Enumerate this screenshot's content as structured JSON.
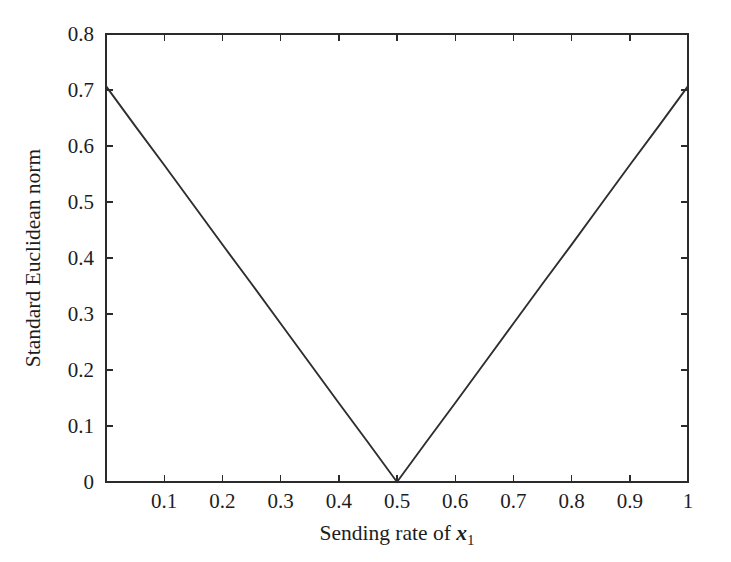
{
  "figure": {
    "background_color": "#ffffff",
    "line_color": "#2e2e2e",
    "axis_color": "#2b2b2b",
    "width": 731,
    "height": 562
  },
  "axes": {
    "x_title_prefix": "Sending rate of ",
    "x_title_var": "x",
    "x_title_sub": "1",
    "y_title": "Standard Euclidean norm",
    "x_tick_labels": [
      "0.1",
      "0.2",
      "0.3",
      "0.4",
      "0.5",
      "0.6",
      "0.7",
      "0.8",
      "0.9",
      "1"
    ],
    "y_tick_labels": [
      "0",
      "0.1",
      "0.2",
      "0.3",
      "0.4",
      "0.5",
      "0.6",
      "0.7",
      "0.8"
    ]
  },
  "chart_data": {
    "type": "line",
    "title": "",
    "subtitle": "",
    "xlabel": "Sending rate of x1",
    "ylabel": "Standard Euclidean norm",
    "xlim": [
      0,
      1
    ],
    "ylim": [
      0,
      0.8
    ],
    "xticks": [
      0,
      0.1,
      0.2,
      0.3,
      0.4,
      0.5,
      0.6,
      0.7,
      0.8,
      0.9,
      1
    ],
    "xticklabels": [
      "",
      "0.1",
      "0.2",
      "0.3",
      "0.4",
      "0.5",
      "0.6",
      "0.7",
      "0.8",
      "0.9",
      "1"
    ],
    "yticks": [
      0,
      0.1,
      0.2,
      0.3,
      0.4,
      0.5,
      0.6,
      0.7,
      0.8
    ],
    "yticklabels": [
      "0",
      "0.1",
      "0.2",
      "0.3",
      "0.4",
      "0.5",
      "0.6",
      "0.7",
      "0.8"
    ],
    "grid": false,
    "legend": false,
    "legend_position": "none",
    "tick_direction": "in",
    "box": true,
    "annotations": [],
    "series": [
      {
        "name": "Standard Euclidean norm",
        "color": "#2e2e2e",
        "linewidth": 1.9,
        "marker": "none",
        "x": [
          0.0,
          0.05,
          0.1,
          0.15,
          0.2,
          0.25,
          0.3,
          0.35,
          0.4,
          0.45,
          0.5,
          0.55,
          0.6,
          0.65,
          0.7,
          0.75,
          0.8,
          0.85,
          0.9,
          0.95,
          1.0
        ],
        "values": [
          0.707,
          0.636,
          0.566,
          0.495,
          0.424,
          0.354,
          0.283,
          0.212,
          0.141,
          0.071,
          0.0,
          0.071,
          0.141,
          0.212,
          0.283,
          0.354,
          0.424,
          0.495,
          0.566,
          0.636,
          0.707
        ]
      }
    ]
  }
}
